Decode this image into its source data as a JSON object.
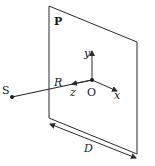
{
  "diagram": {
    "plane_label": "P",
    "source_label": "S",
    "origin_label": "O",
    "axes": {
      "x": "x",
      "y": "y",
      "z": "z"
    },
    "distance_label": "R",
    "width_label": "D",
    "colors": {
      "line": "#2a2a2a",
      "background": "#ffffff"
    }
  }
}
